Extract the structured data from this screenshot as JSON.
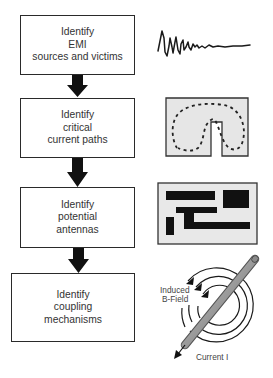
{
  "flowchart": {
    "steps": [
      {
        "lines": [
          "Identify",
          "EMI",
          "sources and victims"
        ]
      },
      {
        "lines": [
          "Identify",
          "critical",
          "current paths"
        ]
      },
      {
        "lines": [
          "Identify",
          "potential",
          "antennas"
        ]
      },
      {
        "lines": [
          "Identify",
          "coupling",
          "mechanisms"
        ]
      }
    ],
    "arrow_color": "#111111",
    "box_border_color": "#2a2a2a"
  },
  "illustrations": {
    "waveform": {
      "icon": "noise-waveform-icon"
    },
    "current_path": {
      "icon": "u-shaped-current-path-icon",
      "fill": "#e6e6e6"
    },
    "pcb_traces": {
      "icon": "pcb-trace-antenna-icon",
      "fill": "#e8e8e8"
    },
    "magnetic_field": {
      "icon": "wire-magnetic-field-icon",
      "label_field_line1": "Induced",
      "label_field_line2": "B-Field",
      "label_current": "Current I"
    }
  }
}
